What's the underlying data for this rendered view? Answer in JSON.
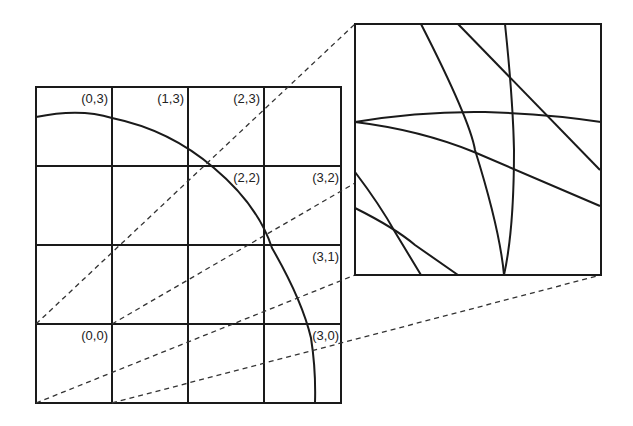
{
  "diagram": {
    "grid": {
      "rows": 4,
      "cols": 4,
      "x": [
        36,
        112,
        188,
        264,
        341
      ],
      "y": [
        87,
        166,
        245,
        324,
        403
      ],
      "labels": [
        {
          "text": "(0,3)",
          "x": 108,
          "y": 103
        },
        {
          "text": "(1,3)",
          "x": 184,
          "y": 103
        },
        {
          "text": "(2,3)",
          "x": 260,
          "y": 103
        },
        {
          "text": "(2,2)",
          "x": 260,
          "y": 182
        },
        {
          "text": "(3,2)",
          "x": 339,
          "y": 182
        },
        {
          "text": "(3,1)",
          "x": 339,
          "y": 261
        },
        {
          "text": "(0,0)",
          "x": 108,
          "y": 340
        },
        {
          "text": "(3,0)",
          "x": 339,
          "y": 340
        }
      ]
    },
    "arc": {
      "description": "quarter circle centered at lower-left corner of grid"
    },
    "zoom_box": {
      "x": 355,
      "y": 24,
      "w": 246,
      "h": 251
    },
    "colors": {
      "stroke": "#1a1a1a",
      "background": "#ffffff"
    }
  }
}
